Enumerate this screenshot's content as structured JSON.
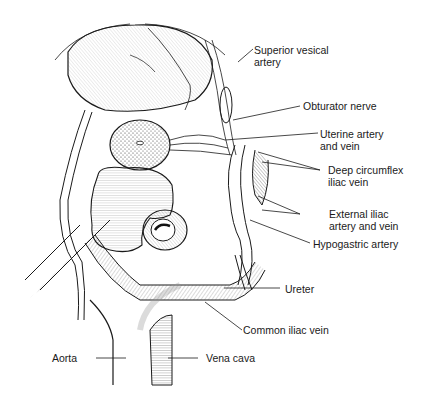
{
  "figure": {
    "type": "anatomical-illustration",
    "style": "pen-and-ink line drawing",
    "background": "#ffffff",
    "ink": "#1a1a1a"
  },
  "labels": [
    {
      "id": "superior-vesical-artery",
      "line1": "Superior vesical",
      "line2": "artery"
    },
    {
      "id": "obturator-nerve",
      "line1": "Obturator nerve"
    },
    {
      "id": "uterine-artery-vein",
      "line1": "Uterine artery",
      "line2": "and vein"
    },
    {
      "id": "deep-circumflex-iliac-vein",
      "line1": "Deep circumflex",
      "line2": "iliac vein"
    },
    {
      "id": "external-iliac-artery-vein",
      "line1": "External iliac",
      "line2": "artery and  vein"
    },
    {
      "id": "hypogastric-artery",
      "line1": "Hypogastric artery"
    },
    {
      "id": "ureter",
      "line1": "Ureter"
    },
    {
      "id": "common-iliac-vein",
      "line1": "Common iliac vein"
    },
    {
      "id": "aorta",
      "line1": "Aorta"
    },
    {
      "id": "vena-cava",
      "line1": "Vena cava"
    }
  ],
  "structures": [
    "bladder",
    "uterus (cervix cross-section)",
    "rectum / sigmoid colon",
    "pelvic vessels",
    "aorta",
    "vena cava"
  ]
}
